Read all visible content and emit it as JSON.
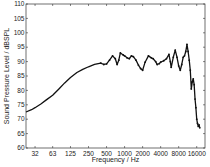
{
  "chart_data": {
    "type": "line",
    "title": "",
    "xlabel": "Frequency / Hz",
    "ylabel": "Sound Pressure Level / dBSPL",
    "xscale": "log",
    "xlim": [
      22.6,
      22000
    ],
    "ylim": [
      60,
      110
    ],
    "grid": false,
    "legend": null,
    "x_ticks": [
      32,
      63,
      125,
      250,
      500,
      1000,
      2000,
      4000,
      8000,
      16000
    ],
    "x_tick_labels": [
      "32",
      "63",
      "125",
      "250",
      "500",
      "1000",
      "2000",
      "4000",
      "8000",
      "16000"
    ],
    "y_ticks": [
      60,
      65,
      70,
      75,
      80,
      85,
      90,
      95,
      100,
      105,
      110
    ],
    "y_tick_labels": [
      "60",
      "65",
      "70",
      "75",
      "80",
      "85",
      "90",
      "95",
      "100",
      "105",
      "110"
    ],
    "series": [
      {
        "name": "SPL",
        "color": "#111111",
        "marker": "dot",
        "x": [
          22.6,
          28,
          32,
          40,
          50,
          63,
          80,
          100,
          125,
          160,
          200,
          250,
          315,
          400,
          450,
          500,
          560,
          630,
          700,
          750,
          800,
          850,
          950,
          1000,
          1100,
          1200,
          1300,
          1400,
          1550,
          1700,
          1850,
          2000,
          2200,
          2500,
          2800,
          3000,
          3300,
          3500,
          3800,
          4000,
          4500,
          5000,
          5500,
          5800,
          6000,
          6500,
          7000,
          7500,
          8000,
          8500,
          9000,
          9500,
          10000,
          10500,
          11000,
          11500,
          12000,
          12500,
          13000,
          13500,
          14000,
          14500,
          15000,
          15500,
          16000,
          16500,
          17000,
          17500,
          18000
        ],
        "values": [
          72.5,
          73.3,
          74,
          75.3,
          76.8,
          78.3,
          80.5,
          82.6,
          84.5,
          86.2,
          87.3,
          88.2,
          89.0,
          89.5,
          89.0,
          89.2,
          90.5,
          92.0,
          91.0,
          89.0,
          90.5,
          93.0,
          92.3,
          92.0,
          91.3,
          91.0,
          92.0,
          91.7,
          90.5,
          88.8,
          87.6,
          87.0,
          89.8,
          92.0,
          91.3,
          91.0,
          90.0,
          89.0,
          89.3,
          89.8,
          90.3,
          91.0,
          92.5,
          90.0,
          88.0,
          91.5,
          94.0,
          91.5,
          88.5,
          87.0,
          89.0,
          91.5,
          92.0,
          93.5,
          96.0,
          93.5,
          90.5,
          87.0,
          80.5,
          83.0,
          84.0,
          82.0,
          77.0,
          74.0,
          70.0,
          68.5,
          67.5,
          68.0,
          67.0
        ]
      }
    ]
  }
}
